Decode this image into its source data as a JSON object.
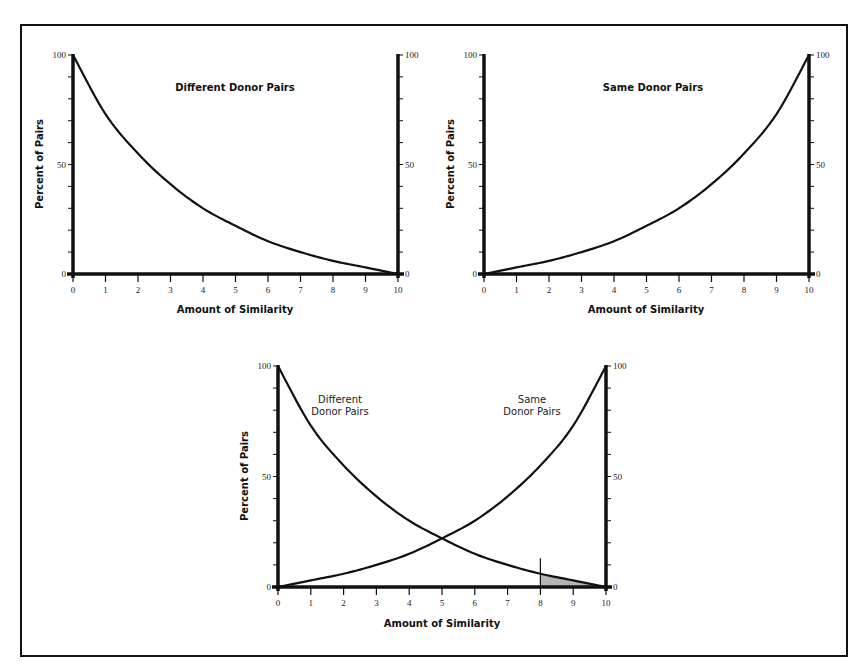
{
  "chart_data": [
    {
      "type": "line",
      "title": "Different Donor Pairs",
      "xlabel": "Amount of Similarity",
      "ylabel": "Percent of Pairs",
      "x": [
        0,
        1,
        2,
        3,
        4,
        5,
        6,
        7,
        8,
        9,
        10
      ],
      "xticks": [
        "0",
        "1",
        "2",
        "3",
        "4",
        "5",
        "6",
        "7",
        "8",
        "9",
        "10"
      ],
      "yticks_left": [
        "0",
        "50",
        "100"
      ],
      "yticks_right": [
        "0",
        "50",
        "100"
      ],
      "xlim": [
        0,
        10
      ],
      "ylim": [
        0,
        100
      ],
      "grid": false,
      "series": [
        {
          "name": "Different Donor Pairs",
          "values": [
            100,
            73,
            55,
            41,
            30,
            22,
            15,
            10,
            6,
            3,
            0
          ]
        }
      ]
    },
    {
      "type": "line",
      "title": "Same Donor Pairs",
      "xlabel": "Amount of Similarity",
      "ylabel": "Percent of Pairs",
      "x": [
        0,
        1,
        2,
        3,
        4,
        5,
        6,
        7,
        8,
        9,
        10
      ],
      "xticks": [
        "0",
        "1",
        "2",
        "3",
        "4",
        "5",
        "6",
        "7",
        "8",
        "9",
        "10"
      ],
      "yticks_left": [
        "0",
        "50",
        "100"
      ],
      "yticks_right": [
        "0",
        "50",
        "100"
      ],
      "xlim": [
        0,
        10
      ],
      "ylim": [
        0,
        100
      ],
      "grid": false,
      "series": [
        {
          "name": "Same Donor Pairs",
          "values": [
            0,
            3,
            6,
            10,
            15,
            22,
            30,
            41,
            55,
            73,
            100
          ]
        }
      ]
    },
    {
      "type": "line",
      "title": "",
      "xlabel": "Amount of Similarity",
      "ylabel": "Percent of Pairs",
      "x": [
        0,
        1,
        2,
        3,
        4,
        5,
        6,
        7,
        8,
        9,
        10
      ],
      "xticks": [
        "0",
        "1",
        "2",
        "3",
        "4",
        "5",
        "6",
        "7",
        "8",
        "9",
        "10"
      ],
      "yticks_left": [
        "0",
        "50",
        "100"
      ],
      "yticks_right": [
        "0",
        "50",
        "100"
      ],
      "xlim": [
        0,
        10
      ],
      "ylim": [
        0,
        100
      ],
      "grid": false,
      "series": [
        {
          "name": "Different Donor Pairs",
          "values": [
            100,
            73,
            55,
            41,
            30,
            22,
            15,
            10,
            6,
            3,
            0
          ]
        },
        {
          "name": "Same Donor Pairs",
          "values": [
            0,
            3,
            6,
            10,
            15,
            22,
            30,
            41,
            55,
            73,
            100
          ]
        }
      ],
      "annotations": [
        {
          "type": "vertical-line",
          "x": 8,
          "y_top": 13
        },
        {
          "type": "shaded-area",
          "x_from": 8,
          "x_to": 10,
          "under_series": "Different Donor Pairs",
          "color": "#b5b5b5"
        },
        {
          "type": "label",
          "text": "Different Donor Pairs",
          "lines": [
            "Different",
            "Donor Pairs"
          ]
        },
        {
          "type": "label",
          "text": "Same Donor Pairs",
          "lines": [
            "Same",
            "Donor Pairs"
          ]
        }
      ]
    }
  ],
  "labels": {
    "chart1_title": "Different Donor Pairs",
    "chart2_title": "Same Donor Pairs",
    "chart3_label_diff_line1": "Different",
    "chart3_label_diff_line2": "Donor Pairs",
    "chart3_label_same_line1": "Same",
    "chart3_label_same_line2": "Donor Pairs",
    "xlabel": "Amount of Similarity",
    "ylabel": "Percent of Pairs"
  },
  "colors": {
    "line": "#111111",
    "shade": "#b5b5b5",
    "frame": "#111111"
  }
}
